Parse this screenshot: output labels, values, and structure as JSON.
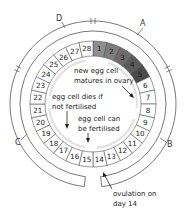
{
  "diagram": {
    "center": [
      93,
      104
    ],
    "days": [
      "1",
      "2",
      "3",
      "4",
      "5",
      "6",
      "7",
      "8",
      "9",
      "10",
      "11",
      "12",
      "13",
      "14",
      "15",
      "16",
      "17",
      "18",
      "19",
      "20",
      "21",
      "22",
      "23",
      "24",
      "25",
      "26",
      "27",
      "28"
    ],
    "shaded_days": [
      1,
      2,
      3,
      4,
      5
    ],
    "colors": {
      "stroke": "#555555",
      "shade_light": "#8e8e8e",
      "shade_dark": "#4a4a4a",
      "inner_arrow": "#e2e2e2",
      "background": "#ffffff"
    },
    "phase_labels": [
      {
        "id": "A",
        "label": "A"
      },
      {
        "id": "B",
        "label": "B"
      },
      {
        "id": "C",
        "label": "C"
      },
      {
        "id": "D",
        "label": "D"
      }
    ],
    "annotations": {
      "matures_line1": "new egg cell",
      "matures_line2": "matures in ovary",
      "dies_line1": "egg cell dies if",
      "dies_line2": "not fertilised",
      "fertilised_line1": "egg cell can",
      "fertilised_line2": "be fertilised",
      "ovulation_line1": "ovulation on",
      "ovulation_line2": "day 14"
    }
  }
}
